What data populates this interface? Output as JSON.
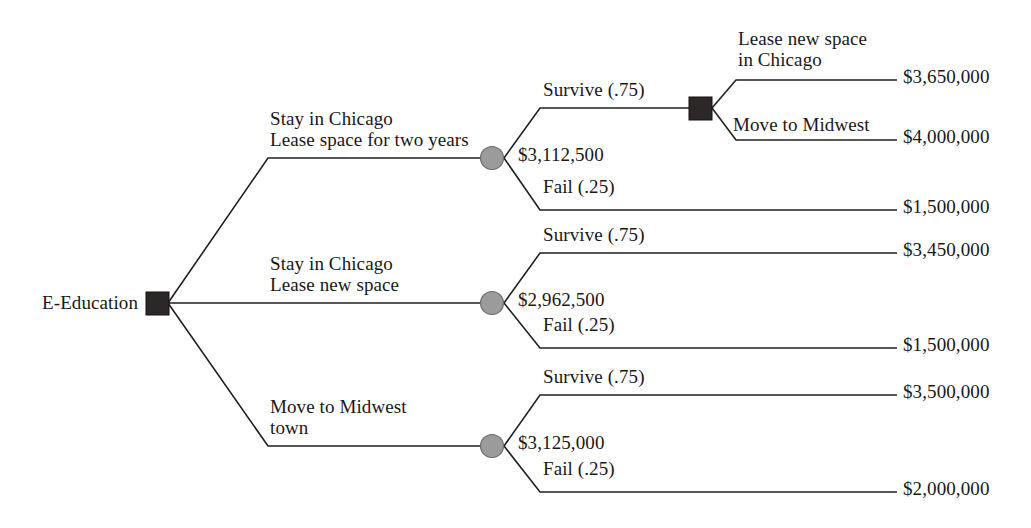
{
  "diagram": {
    "type": "decision-tree",
    "colors": {
      "decision_node": "#2b2827",
      "chance_node": "#9b9b9b",
      "line": "#221f1f",
      "text": "#1a1717",
      "background": "#ffffff"
    },
    "root": {
      "label": "E-Education",
      "node_type": "decision"
    },
    "alternatives": [
      {
        "id": "alt-1",
        "label_line1": "Stay in Chicago",
        "label_line2": "Lease space for two years",
        "expected_value": "$3,112,500",
        "outcomes": [
          {
            "label": "Survive (.75)",
            "probability": 0.75,
            "leads_to": "decision"
          },
          {
            "label": "Fail (.25)",
            "probability": 0.25,
            "payoff": "$1,500,000",
            "value": 1500000
          }
        ],
        "sub_decision": {
          "node_type": "decision",
          "options": [
            {
              "label_line1": "Lease new space",
              "label_line2": "in Chicago",
              "payoff": "$3,650,000",
              "value": 3650000
            },
            {
              "label_line1": "Move to Midwest",
              "label_line2": "",
              "payoff": "$4,000,000",
              "value": 4000000
            }
          ]
        }
      },
      {
        "id": "alt-2",
        "label_line1": "Stay in Chicago",
        "label_line2": "Lease new space",
        "expected_value": "$2,962,500",
        "outcomes": [
          {
            "label": "Survive (.75)",
            "probability": 0.75,
            "payoff": "$3,450,000",
            "value": 3450000
          },
          {
            "label": "Fail (.25)",
            "probability": 0.25,
            "payoff": "$1,500,000",
            "value": 1500000
          }
        ]
      },
      {
        "id": "alt-3",
        "label_line1": "Move to Midwest",
        "label_line2": "town",
        "expected_value": "$3,125,000",
        "outcomes": [
          {
            "label": "Survive (.75)",
            "probability": 0.75,
            "payoff": "$3,500,000",
            "value": 3500000
          },
          {
            "label": "Fail (.25)",
            "probability": 0.25,
            "payoff": "$2,000,000",
            "value": 2000000
          }
        ]
      }
    ]
  }
}
